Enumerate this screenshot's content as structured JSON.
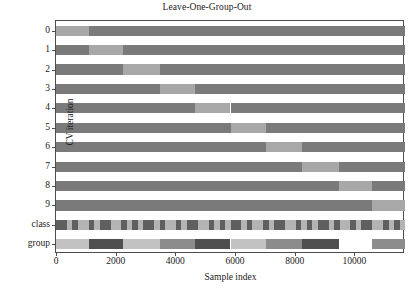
{
  "chart_data": {
    "type": "heatmap",
    "title": "Leave-One-Group-Out",
    "xlabel": "Sample index",
    "ylabel": "CV iteration",
    "xlim": [
      0,
      11700
    ],
    "xticks": [
      0,
      2000,
      4000,
      6000,
      8000,
      10000
    ],
    "xticklabels": [
      "0",
      "2000",
      "4000",
      "6000",
      "8000",
      "10000"
    ],
    "yticklabels": [
      "0",
      "1",
      "2",
      "3",
      "4",
      "5",
      "6",
      "7",
      "8",
      "9",
      "class",
      "group"
    ],
    "grid": false,
    "legend": null,
    "colors": {
      "training": "#7a7a7a",
      "test": "#a8a8a8",
      "class_dark": "#5f5f5f",
      "class_light": "#b4b4b4",
      "group_dark": "#4f4f4f",
      "group_mid": "#8c8c8c",
      "group_light": "#c2c2c2",
      "background": "#ffffff",
      "axis": "#4d4d4d"
    },
    "cv_rows": [
      {
        "iteration": "0",
        "test_start": 0,
        "test_end": 1100
      },
      {
        "iteration": "1",
        "test_start": 1100,
        "test_end": 2250
      },
      {
        "iteration": "2",
        "test_start": 2250,
        "test_end": 3500
      },
      {
        "iteration": "3",
        "test_start": 3500,
        "test_end": 4650
      },
      {
        "iteration": "4",
        "test_start": 4650,
        "test_end": 5850
      },
      {
        "iteration": "5",
        "test_start": 5850,
        "test_end": 7050
      },
      {
        "iteration": "6",
        "test_start": 7050,
        "test_end": 8250
      },
      {
        "iteration": "7",
        "test_start": 8250,
        "test_end": 9500
      },
      {
        "iteration": "8",
        "test_start": 9500,
        "test_end": 10600
      },
      {
        "iteration": "9",
        "test_start": 10600,
        "test_end": 11700
      }
    ],
    "group_row": [
      {
        "start": 0,
        "end": 1100,
        "shade": "group_light"
      },
      {
        "start": 1100,
        "end": 2250,
        "shade": "group_dark"
      },
      {
        "start": 2250,
        "end": 3500,
        "shade": "group_light"
      },
      {
        "start": 3500,
        "end": 4650,
        "shade": "group_mid"
      },
      {
        "start": 4650,
        "end": 5850,
        "shade": "group_dark"
      },
      {
        "start": 5850,
        "end": 7050,
        "shade": "group_light"
      },
      {
        "start": 7050,
        "end": 8250,
        "shade": "group_mid"
      },
      {
        "start": 8250,
        "end": 9500,
        "shade": "group_dark"
      },
      {
        "start": 9500,
        "end": 10600,
        "shade": "background"
      },
      {
        "start": 10600,
        "end": 11700,
        "shade": "group_mid"
      }
    ],
    "class_row_pattern": {
      "description": "fine alternating stripes of dark and light class labels across the full sample index range",
      "stripe_count": 64
    }
  }
}
